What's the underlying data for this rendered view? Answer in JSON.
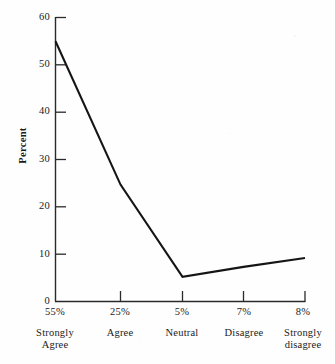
{
  "chart_data": {
    "type": "line",
    "title": "",
    "xlabel": "",
    "ylabel": "Percent",
    "ylim": [
      0,
      60
    ],
    "ytick_values": [
      0,
      10,
      20,
      30,
      40,
      50,
      60
    ],
    "ytick_labels": [
      "0",
      "10",
      "20",
      "30",
      "40",
      "50",
      "60"
    ],
    "grid": false,
    "legend": "none",
    "categories": [
      "Strongly Agree",
      "Agree",
      "Neutral",
      "Disagree",
      "Strongly disagree"
    ],
    "category_lines": [
      [
        "Strongly",
        "Agree"
      ],
      [
        "Agree",
        ""
      ],
      [
        "Neutral",
        ""
      ],
      [
        "Disagree",
        ""
      ],
      [
        "Strongly",
        "disagree"
      ]
    ],
    "xtick_labels": [
      "55%",
      "25%",
      "5%",
      "7%",
      "8%"
    ],
    "values": [
      55,
      24.7,
      5.2,
      7.3,
      9.2
    ],
    "data_labels": [
      "55%",
      "25%",
      "5%",
      "7%",
      "8%"
    ],
    "series": [
      {
        "name": "Percent",
        "values": [
          55,
          24.7,
          5.2,
          7.3,
          9.2
        ]
      }
    ],
    "line_color": "#151515",
    "background_color": "#fefefe",
    "axis_color": "#2a2a2a"
  },
  "axis": {
    "y_title": "Percent"
  }
}
